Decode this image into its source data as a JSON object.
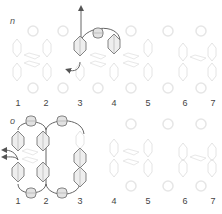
{
  "panels": [
    {
      "step_label": "n",
      "column_numbers": [
        "1",
        "2",
        "3",
        "4",
        "5",
        "6",
        "7"
      ]
    },
    {
      "step_label": "o",
      "column_numbers": [
        "1",
        "2",
        "3",
        "4",
        "5",
        "6",
        "7"
      ]
    }
  ],
  "colors": {
    "thread": "#666666",
    "bead_outline": "#777777",
    "bead_fill": "#e6e6e6",
    "ghost": "#ececec",
    "text": "#444444"
  }
}
